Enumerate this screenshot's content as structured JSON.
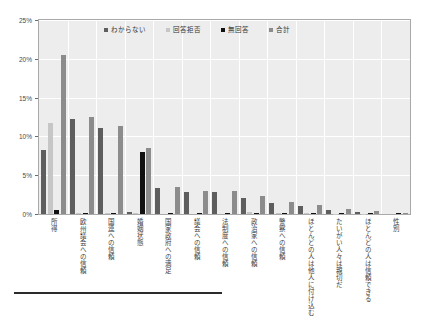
{
  "chart_data": {
    "type": "bar",
    "title": "",
    "subtitle": "",
    "xlabel": "",
    "ylabel": "",
    "ylim": [
      0,
      25
    ],
    "yticks": [
      "0%",
      "5%",
      "10%",
      "15%",
      "20%",
      "25%"
    ],
    "ytick_values": [
      0,
      5,
      10,
      15,
      20,
      25
    ],
    "grid": true,
    "legend_position": "top-center",
    "categories": [
      "所得",
      "欧州議会への信頼",
      "国連への信頼",
      "婚姻状態",
      "国家政府への満足",
      "議会への信頼",
      "法制度への信頼",
      "政治家への信頼",
      "警察への信頼",
      "ほとんどの人は他人に付け込む",
      "たいがい人々は親切だ",
      "ほとんどの人は信頼できる",
      "性別"
    ],
    "series": [
      {
        "name": "わからない",
        "color": "#5e5e5e",
        "values": [
          8.3,
          12.3,
          11.1,
          0.2,
          3.3,
          2.9,
          2.8,
          2.1,
          1.4,
          1.0,
          0.5,
          0.3,
          0.0
        ]
      },
      {
        "name": "回答拒否",
        "color": "#c6c6c6",
        "values": [
          11.7,
          0.1,
          0.1,
          0.1,
          0.0,
          0.0,
          0.0,
          0.2,
          0.1,
          0.1,
          0.05,
          0.05,
          0.0
        ]
      },
      {
        "name": "無回答",
        "color": "#111111",
        "values": [
          0.5,
          0.1,
          0.1,
          8.0,
          0.1,
          0.1,
          0.1,
          0.1,
          0.1,
          0.1,
          0.1,
          0.1,
          0.1
        ]
      },
      {
        "name": "合計",
        "color": "#8c8c8c",
        "values": [
          20.5,
          12.5,
          11.3,
          8.5,
          3.5,
          3.0,
          3.0,
          2.3,
          1.5,
          1.1,
          0.6,
          0.4,
          0.1
        ]
      }
    ]
  },
  "legend": {
    "items": [
      {
        "label": "わからない",
        "color": "#5e5e5e"
      },
      {
        "label": "回答拒否",
        "color": "#c6c6c6"
      },
      {
        "label": "無回答",
        "color": "#111111"
      },
      {
        "label": "合計",
        "color": "#8c8c8c"
      }
    ]
  }
}
